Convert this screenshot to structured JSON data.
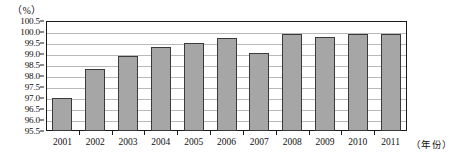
{
  "chart_data": {
    "type": "bar",
    "title": "",
    "subtitle": "",
    "unit_label": "（%）",
    "xlabel": "（年份）",
    "ylabel": "",
    "categories": [
      "2001",
      "2002",
      "2003",
      "2004",
      "2005",
      "2006",
      "2007",
      "2008",
      "2009",
      "2010",
      "2011"
    ],
    "values": [
      97.0,
      98.3,
      98.9,
      99.3,
      99.5,
      99.72,
      99.05,
      99.9,
      99.78,
      99.9,
      99.9
    ],
    "ylim": [
      95.5,
      100.5
    ],
    "ytick_step": 0.5,
    "ytick_labels": [
      "100.5",
      "100.0",
      "99.5",
      "99.0",
      "98.5",
      "98.0",
      "97.5",
      "97.0",
      "96.5",
      "96.0",
      "95.5"
    ],
    "ytick_values": [
      100.5,
      100.0,
      99.5,
      99.0,
      98.5,
      98.0,
      97.5,
      97.0,
      96.5,
      96.0,
      95.5
    ],
    "grid": true,
    "legend": null,
    "legend_position": "none",
    "annotations": [],
    "colors": {
      "bar_fill": "#a6a6a6",
      "bar_stroke": "#3a3a3a",
      "gridline": "#b9b9b9",
      "axis": "#1a1a1a",
      "text": "#111111",
      "background": "#ffffff"
    }
  }
}
